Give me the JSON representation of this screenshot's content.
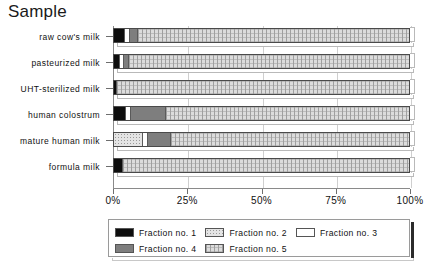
{
  "title": "Sample",
  "axis": {
    "x_ticklabels": [
      "0%",
      "25%",
      "50%",
      "75%",
      "100%"
    ],
    "x_tickvalues": [
      0,
      25,
      50,
      75,
      100
    ]
  },
  "legend": {
    "entries": [
      {
        "label": "Fraction no. 1",
        "key": "f1",
        "color": "#0d0d0d",
        "pattern": "solid-black"
      },
      {
        "label": "Fraction no. 2",
        "key": "f2",
        "color": "#e4e4e4",
        "pattern": "fine-dotted"
      },
      {
        "label": "Fraction no. 3",
        "key": "f3",
        "color": "#ffffff",
        "pattern": "empty-white"
      },
      {
        "label": "Fraction no. 4",
        "key": "f4",
        "color": "#7e7e7e",
        "pattern": "solid-gray"
      },
      {
        "label": "Fraction no. 5",
        "key": "f5",
        "color": "#dcdcdc",
        "pattern": "cross-hatch-grid"
      }
    ]
  },
  "chart_data": {
    "type": "bar",
    "orientation": "horizontal",
    "stacked": true,
    "normalized_percent": true,
    "title": "Sample",
    "xlabel": "",
    "ylabel": "Sample",
    "xlim": [
      0,
      100
    ],
    "grid": true,
    "legend_position": "bottom",
    "categories": [
      "raw cow's milk",
      "pasteurized milk",
      "UHT-sterilized milk",
      "human colostrum",
      "mature human milk",
      "formula milk"
    ],
    "series": [
      {
        "name": "Fraction no. 1",
        "values": [
          3.5,
          1.8,
          0.6,
          3.8,
          0.0,
          2.6
        ]
      },
      {
        "name": "Fraction no. 2",
        "values": [
          0.0,
          0.0,
          0.0,
          0.0,
          9.5,
          0.0
        ]
      },
      {
        "name": "Fraction no. 3",
        "values": [
          1.2,
          1.0,
          0.0,
          1.4,
          1.6,
          0.0
        ]
      },
      {
        "name": "Fraction no. 4",
        "values": [
          2.6,
          1.4,
          0.0,
          11.5,
          7.4,
          0.0
        ]
      },
      {
        "name": "Fraction no. 5",
        "values": [
          92.7,
          95.8,
          99.4,
          83.3,
          81.5,
          97.4
        ]
      }
    ]
  }
}
